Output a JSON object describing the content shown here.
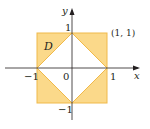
{
  "diagram": {
    "region_label": "D",
    "corner_label": "(1, 1)",
    "axis_x_label": "x",
    "axis_y_label": "y",
    "ticks": {
      "x_neg": "−1",
      "x_pos": "1",
      "origin": "0",
      "y_pos": "1",
      "y_neg": "−1"
    },
    "colors": {
      "fill": "#fbd98a",
      "edge": "#f0b94a",
      "axis": "#231f20",
      "inner": "#ffffff"
    }
  }
}
